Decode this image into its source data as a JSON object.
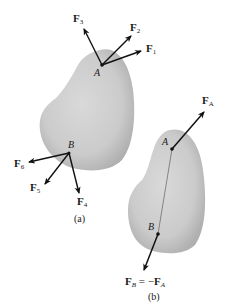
{
  "figure_a": {
    "caption": "(a)",
    "body_color": "#c8c8c8",
    "points": {
      "A": {
        "label": "A"
      },
      "B": {
        "label": "B"
      }
    },
    "forces": [
      {
        "name": "F",
        "sub": "1",
        "applied_at": "A"
      },
      {
        "name": "F",
        "sub": "2",
        "applied_at": "A"
      },
      {
        "name": "F",
        "sub": "3",
        "applied_at": "A"
      },
      {
        "name": "F",
        "sub": "4",
        "applied_at": "B"
      },
      {
        "name": "F",
        "sub": "5",
        "applied_at": "B"
      },
      {
        "name": "F",
        "sub": "6",
        "applied_at": "B"
      }
    ]
  },
  "figure_b": {
    "caption": "(b)",
    "body_color": "#c8c8c8",
    "points": {
      "A": {
        "label": "A"
      },
      "B": {
        "label": "B"
      }
    },
    "forces": [
      {
        "name": "F",
        "sub": "A",
        "applied_at": "A"
      },
      {
        "name": "F",
        "sub": "B",
        "applied_at": "B",
        "equation": "= −",
        "equals_name": "F",
        "equals_sub": "A"
      }
    ]
  }
}
